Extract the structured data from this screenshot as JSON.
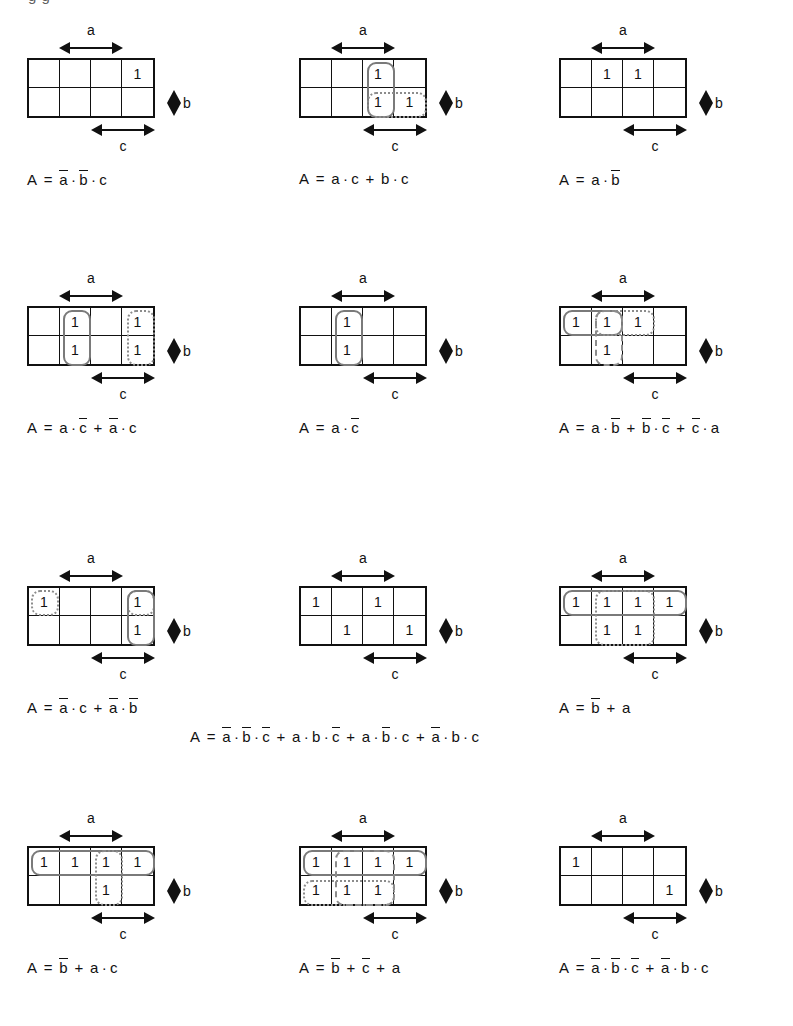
{
  "page": {
    "top_fragment": "g    g",
    "axis_labels": {
      "a": "a",
      "b": "b",
      "c": "c"
    },
    "cell_one": "1"
  },
  "maps": [
    {
      "id": "kmap-1",
      "position": {
        "x": 0,
        "y": 20
      },
      "ones": [
        [
          0,
          3
        ]
      ],
      "groups": [],
      "equation": {
        "text": "A = ā · b̄ · c",
        "terms": [
          {
            "var": "A",
            "bar": false
          },
          {
            "op": "="
          },
          {
            "var": "a",
            "bar": true
          },
          {
            "op": "·"
          },
          {
            "var": "b",
            "bar": true
          },
          {
            "op": "·"
          },
          {
            "var": "c",
            "bar": false
          }
        ]
      }
    },
    {
      "id": "kmap-2",
      "position": {
        "x": 272,
        "y": 20
      },
      "ones": [
        [
          0,
          2
        ],
        [
          1,
          2
        ],
        [
          1,
          3
        ]
      ],
      "groups": [
        {
          "style": "solid",
          "row": 0,
          "col": 2,
          "rowspan": 2,
          "colspan": 1
        },
        {
          "style": "dotted",
          "row": 1,
          "col": 2,
          "rowspan": 1,
          "colspan": 2
        }
      ],
      "equation": {
        "text": "A = a · c + b · c",
        "terms": [
          {
            "var": "A",
            "bar": false
          },
          {
            "op": "="
          },
          {
            "var": "a",
            "bar": false
          },
          {
            "op": "·"
          },
          {
            "var": "c",
            "bar": false
          },
          {
            "op": "+"
          },
          {
            "var": "b",
            "bar": false
          },
          {
            "op": "·"
          },
          {
            "var": "c",
            "bar": false
          }
        ]
      }
    },
    {
      "id": "kmap-3",
      "position": {
        "x": 532,
        "y": 20
      },
      "ones": [
        [
          0,
          1
        ],
        [
          0,
          2
        ]
      ],
      "groups": [],
      "equation": {
        "text": "A = a · b̄",
        "terms": [
          {
            "var": "A",
            "bar": false
          },
          {
            "op": "="
          },
          {
            "var": "a",
            "bar": false
          },
          {
            "op": "·"
          },
          {
            "var": "b",
            "bar": true
          }
        ]
      }
    },
    {
      "id": "kmap-4",
      "position": {
        "x": 0,
        "y": 268
      },
      "ones": [
        [
          0,
          1
        ],
        [
          1,
          1
        ],
        [
          0,
          3
        ],
        [
          1,
          3
        ]
      ],
      "groups": [
        {
          "style": "solid",
          "row": 0,
          "col": 1,
          "rowspan": 2,
          "colspan": 1
        },
        {
          "style": "dotted",
          "row": 0,
          "col": 3,
          "rowspan": 2,
          "colspan": 1
        }
      ],
      "equation": {
        "text": "A = a · c̄ + ā · c",
        "terms": [
          {
            "var": "A",
            "bar": false
          },
          {
            "op": "="
          },
          {
            "var": "a",
            "bar": false
          },
          {
            "op": "·"
          },
          {
            "var": "c",
            "bar": true
          },
          {
            "op": "+"
          },
          {
            "var": "a",
            "bar": true
          },
          {
            "op": "·"
          },
          {
            "var": "c",
            "bar": false
          }
        ]
      }
    },
    {
      "id": "kmap-5",
      "position": {
        "x": 272,
        "y": 268
      },
      "ones": [
        [
          0,
          1
        ],
        [
          1,
          1
        ]
      ],
      "groups": [
        {
          "style": "solid",
          "row": 0,
          "col": 1,
          "rowspan": 2,
          "colspan": 1
        }
      ],
      "equation": {
        "text": "A = a · c̄",
        "terms": [
          {
            "var": "A",
            "bar": false
          },
          {
            "op": "="
          },
          {
            "var": "a",
            "bar": false
          },
          {
            "op": "·"
          },
          {
            "var": "c",
            "bar": true
          }
        ]
      }
    },
    {
      "id": "kmap-6",
      "position": {
        "x": 532,
        "y": 268
      },
      "ones": [
        [
          0,
          0
        ],
        [
          0,
          1
        ],
        [
          0,
          2
        ],
        [
          1,
          1
        ]
      ],
      "groups": [
        {
          "style": "solid",
          "row": 0,
          "col": 0,
          "rowspan": 1,
          "colspan": 2
        },
        {
          "style": "dashed",
          "row": 0,
          "col": 1,
          "rowspan": 2,
          "colspan": 1
        },
        {
          "style": "dotted",
          "row": 0,
          "col": 1,
          "rowspan": 1,
          "colspan": 2
        }
      ],
      "equation": {
        "text": "A = a · b̄ + b̄ · c̄ + c̄ · a",
        "terms": [
          {
            "var": "A",
            "bar": false
          },
          {
            "op": "="
          },
          {
            "var": "a",
            "bar": false
          },
          {
            "op": "·"
          },
          {
            "var": "b",
            "bar": true
          },
          {
            "op": "+"
          },
          {
            "var": "b",
            "bar": true
          },
          {
            "op": "·"
          },
          {
            "var": "c",
            "bar": true
          },
          {
            "op": "+"
          },
          {
            "var": "c",
            "bar": true
          },
          {
            "op": "·"
          },
          {
            "var": "a",
            "bar": false
          }
        ]
      }
    },
    {
      "id": "kmap-7",
      "position": {
        "x": 0,
        "y": 548
      },
      "ones": [
        [
          0,
          0
        ],
        [
          0,
          3
        ],
        [
          1,
          3
        ]
      ],
      "groups": [
        {
          "style": "dotted",
          "row": 0,
          "col": 0,
          "rowspan": 1,
          "colspan": 1
        },
        {
          "style": "dotted",
          "row": 0,
          "col": 3,
          "rowspan": 1,
          "colspan": 1
        },
        {
          "style": "solid",
          "row": 0,
          "col": 3,
          "rowspan": 2,
          "colspan": 1
        }
      ],
      "equation": {
        "text": "A = ā · c + ā · b̄",
        "terms": [
          {
            "var": "A",
            "bar": false
          },
          {
            "op": "="
          },
          {
            "var": "a",
            "bar": true
          },
          {
            "op": "·"
          },
          {
            "var": "c",
            "bar": false
          },
          {
            "op": "+"
          },
          {
            "var": "a",
            "bar": true
          },
          {
            "op": "·"
          },
          {
            "var": "b",
            "bar": true
          }
        ]
      }
    },
    {
      "id": "kmap-8",
      "position": {
        "x": 272,
        "y": 548
      },
      "ones": [
        [
          0,
          0
        ],
        [
          0,
          2
        ],
        [
          1,
          1
        ],
        [
          1,
          3
        ]
      ],
      "groups": [],
      "equation": null
    },
    {
      "id": "kmap-9",
      "position": {
        "x": 532,
        "y": 548
      },
      "ones": [
        [
          0,
          0
        ],
        [
          0,
          1
        ],
        [
          0,
          2
        ],
        [
          0,
          3
        ],
        [
          1,
          1
        ],
        [
          1,
          2
        ]
      ],
      "groups": [
        {
          "style": "solid",
          "row": 0,
          "col": 0,
          "rowspan": 1,
          "colspan": 4
        },
        {
          "style": "dotted",
          "row": 0,
          "col": 1,
          "rowspan": 2,
          "colspan": 2
        }
      ],
      "equation": {
        "text": "A = b̄ + a",
        "terms": [
          {
            "var": "A",
            "bar": false
          },
          {
            "op": "="
          },
          {
            "var": "b",
            "bar": true
          },
          {
            "op": "+"
          },
          {
            "var": "a",
            "bar": false
          }
        ]
      }
    },
    {
      "id": "kmap-10",
      "position": {
        "x": 0,
        "y": 808
      },
      "ones": [
        [
          0,
          0
        ],
        [
          0,
          1
        ],
        [
          0,
          2
        ],
        [
          0,
          3
        ],
        [
          1,
          2
        ]
      ],
      "groups": [
        {
          "style": "solid",
          "row": 0,
          "col": 0,
          "rowspan": 1,
          "colspan": 4
        },
        {
          "style": "dotted",
          "row": 0,
          "col": 2,
          "rowspan": 2,
          "colspan": 1
        }
      ],
      "equation": {
        "text": "A = b̄ + a · c",
        "terms": [
          {
            "var": "A",
            "bar": false
          },
          {
            "op": "="
          },
          {
            "var": "b",
            "bar": true
          },
          {
            "op": "+"
          },
          {
            "var": "a",
            "bar": false
          },
          {
            "op": "·"
          },
          {
            "var": "c",
            "bar": false
          }
        ]
      }
    },
    {
      "id": "kmap-11",
      "position": {
        "x": 272,
        "y": 808
      },
      "ones": [
        [
          0,
          0
        ],
        [
          0,
          1
        ],
        [
          0,
          2
        ],
        [
          0,
          3
        ],
        [
          1,
          0
        ],
        [
          1,
          1
        ],
        [
          1,
          2
        ]
      ],
      "groups": [
        {
          "style": "solid",
          "row": 0,
          "col": 0,
          "rowspan": 1,
          "colspan": 4
        },
        {
          "style": "dotted",
          "row": 1,
          "col": 0,
          "rowspan": 1,
          "colspan": 3
        },
        {
          "style": "dashed",
          "row": 0,
          "col": 1,
          "rowspan": 2,
          "colspan": 2
        }
      ],
      "equation": {
        "text": "A = b̄ + c̄ + a",
        "terms": [
          {
            "var": "A",
            "bar": false
          },
          {
            "op": "="
          },
          {
            "var": "b",
            "bar": true
          },
          {
            "op": "+"
          },
          {
            "var": "c",
            "bar": true
          },
          {
            "op": "+"
          },
          {
            "var": "a",
            "bar": false
          }
        ]
      }
    },
    {
      "id": "kmap-12",
      "position": {
        "x": 532,
        "y": 808
      },
      "ones": [
        [
          0,
          0
        ],
        [
          1,
          3
        ]
      ],
      "groups": [],
      "equation": {
        "text": "A = ā · b̄ · c̄ + ā · b · c",
        "terms": [
          {
            "var": "A",
            "bar": false
          },
          {
            "op": "="
          },
          {
            "var": "a",
            "bar": true
          },
          {
            "op": "·"
          },
          {
            "var": "b",
            "bar": true
          },
          {
            "op": "·"
          },
          {
            "var": "c",
            "bar": true
          },
          {
            "op": "+"
          },
          {
            "var": "a",
            "bar": true
          },
          {
            "op": "·"
          },
          {
            "var": "b",
            "bar": false
          },
          {
            "op": "·"
          },
          {
            "var": "c",
            "bar": false
          }
        ]
      }
    }
  ],
  "center_equation": {
    "text": "A = ā · b̄ · c̄ + a · b · c̄ + a · b̄ · c + ā · b · c",
    "terms": [
      {
        "var": "A",
        "bar": false
      },
      {
        "op": "="
      },
      {
        "var": "a",
        "bar": true
      },
      {
        "op": "·"
      },
      {
        "var": "b",
        "bar": true
      },
      {
        "op": "·"
      },
      {
        "var": "c",
        "bar": true
      },
      {
        "op": "+"
      },
      {
        "var": "a",
        "bar": false
      },
      {
        "op": "·"
      },
      {
        "var": "b",
        "bar": false
      },
      {
        "op": "·"
      },
      {
        "var": "c",
        "bar": true
      },
      {
        "op": "+"
      },
      {
        "var": "a",
        "bar": false
      },
      {
        "op": "·"
      },
      {
        "var": "b",
        "bar": true
      },
      {
        "op": "·"
      },
      {
        "var": "c",
        "bar": false
      },
      {
        "op": "+"
      },
      {
        "var": "a",
        "bar": true
      },
      {
        "op": "·"
      },
      {
        "var": "b",
        "bar": false
      },
      {
        "op": "·"
      },
      {
        "var": "c",
        "bar": false
      }
    ]
  }
}
